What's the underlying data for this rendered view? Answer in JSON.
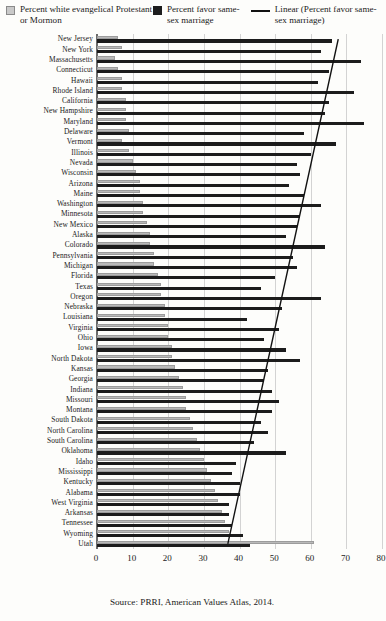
{
  "legend": {
    "items": [
      {
        "marker": "square-grey",
        "label": "Percent white evangelical Protestant or Mormon"
      },
      {
        "marker": "square-black",
        "label": "Percent favor same-sex marriage"
      },
      {
        "marker": "line-black",
        "label": "Linear (Percent favor same-sex marriage)"
      }
    ]
  },
  "source": "Source: PRRI, American Values Atlas, 2014.",
  "colors": {
    "evangelical_bar": "#b9b9b9",
    "marriage_bar": "#1c1c1c",
    "trend_line": "#111111",
    "gridline": "#d3d3d3",
    "axis": "#6b6b6b"
  },
  "chart_data": {
    "type": "bar",
    "orientation": "horizontal",
    "title": "",
    "xlabel": "",
    "ylabel": "",
    "xlim": [
      0,
      80
    ],
    "xticks": [
      0,
      10,
      20,
      30,
      40,
      50,
      60,
      70,
      80
    ],
    "grid": true,
    "legend_position": "top",
    "categories": [
      "New Jersey",
      "New York",
      "Massachusetts",
      "Connecticut",
      "Hawaii",
      "Rhode Island",
      "California",
      "New Hampshire",
      "Maryland",
      "Delaware",
      "Vermont",
      "Illinois",
      "Nevada",
      "Wisconsin",
      "Arizona",
      "Maine",
      "Washington",
      "Minnesota",
      "New Mexico",
      "Alaska",
      "Colorado",
      "Pennsylvania",
      "Michigan",
      "Florida",
      "Texas",
      "Oregon",
      "Nebraska",
      "Louisiana",
      "Virginia",
      "Ohio",
      "Iowa",
      "North Dakota",
      "Kansas",
      "Georgia",
      "Indiana",
      "Missouri",
      "Montana",
      "South Dakota",
      "North Carolina",
      "South Carolina",
      "Oklahoma",
      "Idaho",
      "Mississippi",
      "Kentucky",
      "Alabama",
      "West Virginia",
      "Arkansas",
      "Tennessee",
      "Wyoming",
      "Utah"
    ],
    "series": [
      {
        "name": "Percent white evangelical Protestant or Mormon",
        "color": "#b9b9b9",
        "values": [
          6,
          7,
          5,
          6,
          7,
          7,
          8,
          8,
          8,
          9,
          7,
          9,
          10,
          11,
          12,
          12,
          13,
          13,
          14,
          15,
          15,
          16,
          16,
          17,
          18,
          18,
          19,
          19,
          20,
          20,
          21,
          21,
          22,
          23,
          24,
          25,
          25,
          26,
          27,
          28,
          29,
          30,
          31,
          32,
          33,
          34,
          35,
          36,
          37,
          61
        ]
      },
      {
        "name": "Percent favor same-sex marriage",
        "color": "#1c1c1c",
        "values": [
          66,
          63,
          74,
          65,
          62,
          72,
          65,
          64,
          75,
          58,
          67,
          60,
          56,
          57,
          54,
          58,
          63,
          57,
          56,
          53,
          64,
          55,
          56,
          50,
          46,
          63,
          52,
          42,
          51,
          47,
          53,
          57,
          48,
          47,
          49,
          51,
          49,
          46,
          48,
          44,
          53,
          39,
          38,
          40,
          40,
          37,
          37,
          38,
          41,
          43
        ]
      }
    ],
    "trendline": {
      "name": "Linear (Percent favor same-sex marriage)",
      "type": "linear",
      "color": "#111111",
      "x_at_first_category": 68,
      "x_at_last_category": 37
    }
  }
}
